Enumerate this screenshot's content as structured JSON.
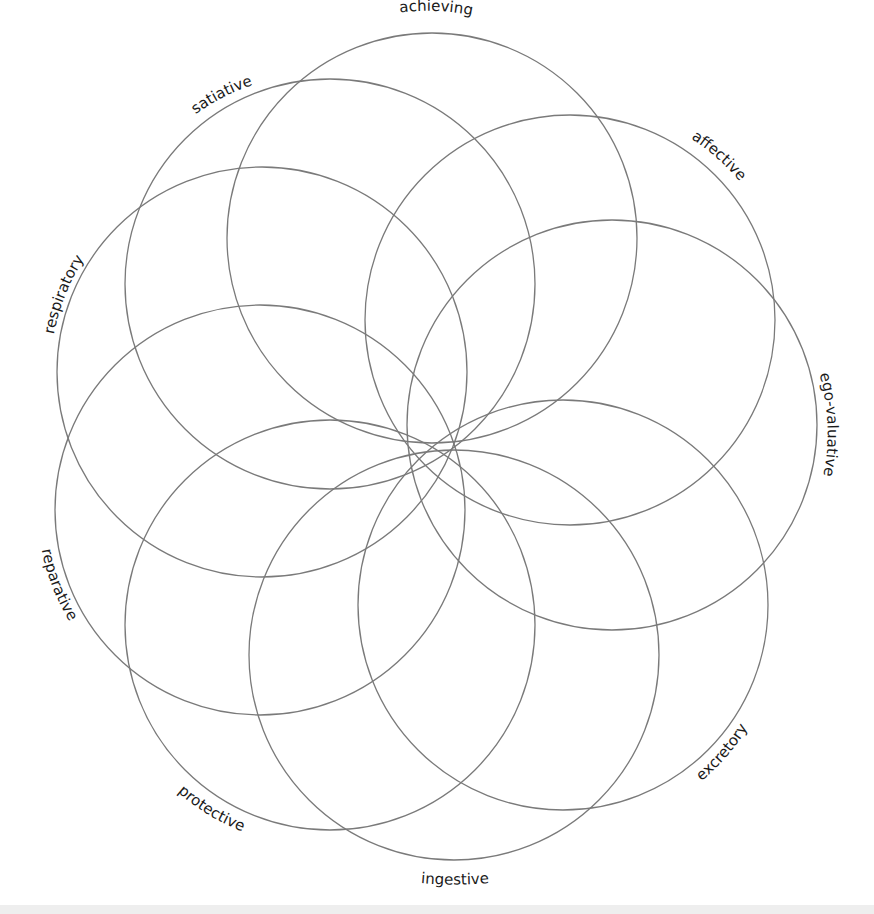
{
  "diagram": {
    "type": "overlapping-circles-rosette",
    "stroke_color": "#7a7a7a",
    "label_color": "#1a1a1a",
    "common_point": [
      435,
      455
    ],
    "radius": 205,
    "circles": [
      {
        "id": "achieving",
        "label": "achieving",
        "cx": 432,
        "cy": 238
      },
      {
        "id": "affective",
        "label": "affective",
        "cx": 570,
        "cy": 320
      },
      {
        "id": "ego-valuative",
        "label": "ego-valuative",
        "cx": 612,
        "cy": 425
      },
      {
        "id": "excretory",
        "label": "excretory",
        "cx": 563,
        "cy": 605
      },
      {
        "id": "ingestive",
        "label": "ingestive",
        "cx": 454,
        "cy": 655
      },
      {
        "id": "protective",
        "label": "protective",
        "cx": 330,
        "cy": 625
      },
      {
        "id": "reparative",
        "label": "reparative",
        "cx": 260,
        "cy": 510
      },
      {
        "id": "respiratory",
        "label": "respiratory",
        "cx": 262,
        "cy": 372
      },
      {
        "id": "satiative",
        "label": "satiative",
        "cx": 330,
        "cy": 284
      }
    ]
  }
}
